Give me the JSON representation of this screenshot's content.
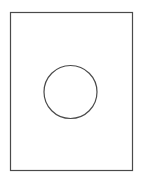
{
  "diagram": {
    "shapes": [
      {
        "kind": "rectangle",
        "role": "outer-frame"
      },
      {
        "kind": "circle",
        "role": "inner-circle"
      }
    ],
    "colors": {
      "background": "#ffffff",
      "stroke": "#4a4a4a"
    }
  }
}
